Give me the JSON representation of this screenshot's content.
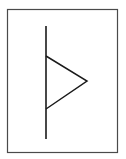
{
  "diagram": {
    "type": "symbol",
    "symbol": "vertical-line-with-right-triangle",
    "colors": {
      "background": "#ffffff",
      "frame": "#4a4a4a",
      "stroke": "#1a1a1a"
    },
    "frame": {
      "x": 7.5,
      "y": 9.5,
      "width": 110,
      "height": 143
    },
    "line": {
      "x": 46,
      "y1": 26,
      "y2": 139
    },
    "triangle": {
      "points": "46,56 87,81 46,109"
    }
  }
}
